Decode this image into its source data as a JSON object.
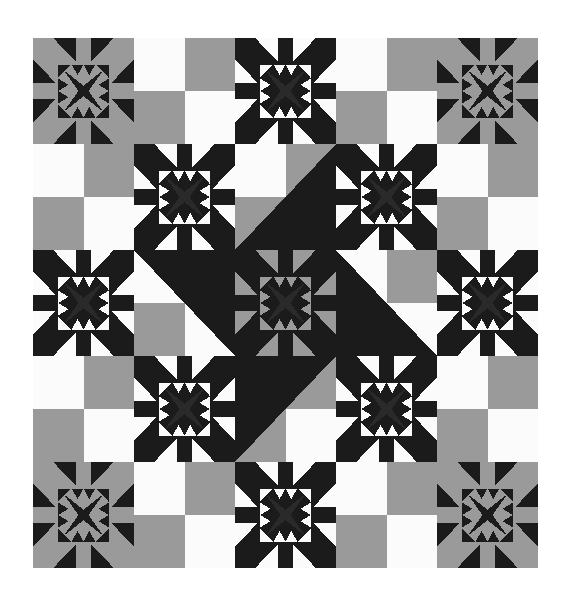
{
  "artwork": {
    "title": "Feathered Star Quilt",
    "kind": "quilt-pattern",
    "canvas": {
      "width": 571,
      "height": 609,
      "background": "#ffffff"
    },
    "quilt": {
      "x": 33,
      "y": 38,
      "width": 505,
      "height": 530,
      "rows": 5,
      "cols": 5
    },
    "palette": {
      "black": "#1b1b1b",
      "charcoal": "#2a2a2a",
      "gray": "#9a9a9a",
      "white": "#fbfbfb",
      "background": "#ffffff"
    },
    "block_types": {
      "star_dark": "feathered star, black ground with gray points",
      "star_light": "feathered star, white ground with black points",
      "star_center": "feathered star, gray ground with black points",
      "four_patch": "two-color four patch, white and gray",
      "four_patch_tri": "four patch with black corner triangle"
    },
    "grid": [
      [
        {
          "type": "star_dark",
          "ground": "#1b1b1b",
          "points": "#9a9a9a",
          "center": "#1b1b1b"
        },
        {
          "type": "four_patch",
          "tl": "#fbfbfb",
          "tr": "#9a9a9a",
          "bl": "#9a9a9a",
          "br": "#fbfbfb",
          "tri": "none"
        },
        {
          "type": "star_light",
          "ground": "#fbfbfb",
          "points": "#1b1b1b",
          "center": "#1b1b1b"
        },
        {
          "type": "four_patch",
          "tl": "#fbfbfb",
          "tr": "#9a9a9a",
          "bl": "#9a9a9a",
          "br": "#fbfbfb",
          "tri": "none"
        },
        {
          "type": "star_dark",
          "ground": "#1b1b1b",
          "points": "#9a9a9a",
          "center": "#1b1b1b"
        }
      ],
      [
        {
          "type": "four_patch",
          "tl": "#fbfbfb",
          "tr": "#9a9a9a",
          "bl": "#9a9a9a",
          "br": "#fbfbfb",
          "tri": "none"
        },
        {
          "type": "star_light",
          "ground": "#fbfbfb",
          "points": "#1b1b1b",
          "center": "#1b1b1b"
        },
        {
          "type": "four_patch",
          "tl": "#fbfbfb",
          "tr": "#9a9a9a",
          "bl": "#9a9a9a",
          "br": "#fbfbfb",
          "tri": "br"
        },
        {
          "type": "star_light",
          "ground": "#fbfbfb",
          "points": "#1b1b1b",
          "center": "#1b1b1b"
        },
        {
          "type": "four_patch",
          "tl": "#fbfbfb",
          "tr": "#9a9a9a",
          "bl": "#9a9a9a",
          "br": "#fbfbfb",
          "tri": "none"
        }
      ],
      [
        {
          "type": "star_light",
          "ground": "#fbfbfb",
          "points": "#1b1b1b",
          "center": "#1b1b1b"
        },
        {
          "type": "four_patch",
          "tl": "#fbfbfb",
          "tr": "#9a9a9a",
          "bl": "#9a9a9a",
          "br": "#fbfbfb",
          "tri": "tr"
        },
        {
          "type": "star_center",
          "ground": "#9a9a9a",
          "points": "#1b1b1b",
          "center": "#1b1b1b"
        },
        {
          "type": "four_patch",
          "tl": "#fbfbfb",
          "tr": "#9a9a9a",
          "bl": "#9a9a9a",
          "br": "#fbfbfb",
          "tri": "bl"
        },
        {
          "type": "star_light",
          "ground": "#fbfbfb",
          "points": "#1b1b1b",
          "center": "#1b1b1b"
        }
      ],
      [
        {
          "type": "four_patch",
          "tl": "#fbfbfb",
          "tr": "#9a9a9a",
          "bl": "#9a9a9a",
          "br": "#fbfbfb",
          "tri": "none"
        },
        {
          "type": "star_light",
          "ground": "#fbfbfb",
          "points": "#1b1b1b",
          "center": "#1b1b1b"
        },
        {
          "type": "four_patch",
          "tl": "#fbfbfb",
          "tr": "#9a9a9a",
          "bl": "#9a9a9a",
          "br": "#fbfbfb",
          "tri": "tl"
        },
        {
          "type": "star_light",
          "ground": "#fbfbfb",
          "points": "#1b1b1b",
          "center": "#1b1b1b"
        },
        {
          "type": "four_patch",
          "tl": "#fbfbfb",
          "tr": "#9a9a9a",
          "bl": "#9a9a9a",
          "br": "#fbfbfb",
          "tri": "none"
        }
      ],
      [
        {
          "type": "star_dark",
          "ground": "#1b1b1b",
          "points": "#9a9a9a",
          "center": "#1b1b1b"
        },
        {
          "type": "four_patch",
          "tl": "#fbfbfb",
          "tr": "#9a9a9a",
          "bl": "#9a9a9a",
          "br": "#fbfbfb",
          "tri": "none"
        },
        {
          "type": "star_light",
          "ground": "#fbfbfb",
          "points": "#1b1b1b",
          "center": "#1b1b1b"
        },
        {
          "type": "four_patch",
          "tl": "#fbfbfb",
          "tr": "#9a9a9a",
          "bl": "#9a9a9a",
          "br": "#fbfbfb",
          "tri": "none"
        },
        {
          "type": "star_dark",
          "ground": "#1b1b1b",
          "points": "#9a9a9a",
          "center": "#1b1b1b"
        }
      ]
    ]
  }
}
